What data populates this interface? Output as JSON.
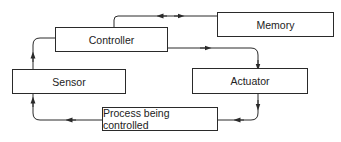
{
  "diagram": {
    "type": "control-loop block diagram",
    "colors": {
      "line": "#2a2a2a",
      "text": "#222222",
      "background": "#ffffff"
    },
    "nodes": [
      {
        "id": "controller",
        "label": "Controller"
      },
      {
        "id": "memory",
        "label": "Memory"
      },
      {
        "id": "sensor",
        "label": "Sensor"
      },
      {
        "id": "actuator",
        "label": "Actuator"
      },
      {
        "id": "process",
        "label": "Process being controlled"
      }
    ],
    "edges": [
      {
        "from": "controller",
        "to": "memory",
        "bidirectional": true
      },
      {
        "from": "controller",
        "to": "actuator"
      },
      {
        "from": "actuator",
        "to": "process"
      },
      {
        "from": "process",
        "to": "sensor"
      },
      {
        "from": "sensor",
        "to": "controller"
      }
    ]
  }
}
